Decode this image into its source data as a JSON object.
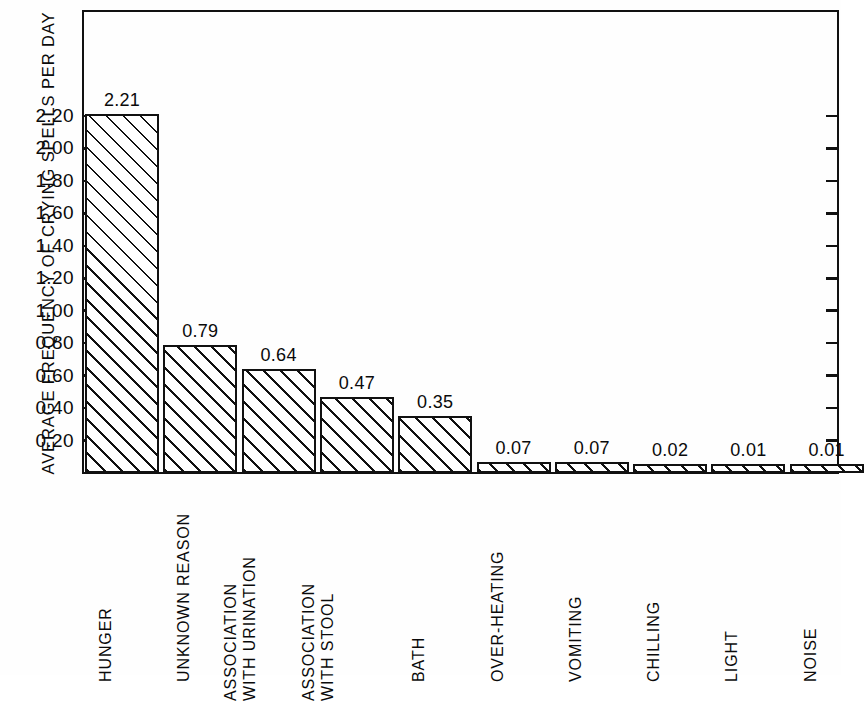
{
  "chart_data": {
    "type": "bar",
    "title": "",
    "xlabel": "",
    "ylabel": "AVERAGE FREQUENCY OF CRYING SPELLS PER DAY",
    "ylim": [
      0,
      2.32
    ],
    "grid": false,
    "legend": null,
    "categories": [
      "HUNGER",
      "UNKNOWN REASON",
      "ASSOCIATION WITH URINATION",
      "ASSOCIATION WITH STOOL",
      "BATH",
      "OVER-HEATING",
      "VOMITING",
      "CHILLING",
      "LIGHT",
      "NOISE"
    ],
    "values": [
      2.21,
      0.79,
      0.64,
      0.47,
      0.35,
      0.07,
      0.07,
      0.02,
      0.01,
      0.01
    ],
    "value_labels": [
      "2.21",
      "0.79",
      "0.64",
      "0.47",
      "0.35",
      "0.07",
      "0.07",
      "0.02",
      "0.01",
      "0.01"
    ],
    "ytick_values": [
      2.2,
      2.0,
      1.8,
      1.6,
      1.4,
      1.2,
      1.0,
      0.8,
      0.6,
      0.4,
      0.2
    ],
    "ytick_labels": [
      "2.20",
      "2.00",
      "1.80",
      "1.60",
      "1.40",
      "1.20",
      "1.00",
      "0.80",
      "0.60",
      "0.40",
      "0.20"
    ],
    "category_label_lines": [
      [
        "HUNGER"
      ],
      [
        "UNKNOWN REASON"
      ],
      [
        "ASSOCIATION",
        "WITH URINATION"
      ],
      [
        "ASSOCIATION",
        "WITH STOOL"
      ],
      [
        "BATH"
      ],
      [
        "OVER-HEATING"
      ],
      [
        "VOMITING"
      ],
      [
        "CHILLING"
      ],
      [
        "LIGHT"
      ],
      [
        "NOISE"
      ]
    ],
    "colors": {
      "background": "#fefefe",
      "axis": "#111111",
      "bar_edge": "#111111",
      "bar_fill": "#ffffff",
      "hatch": "#111111",
      "text": "#0a0a0a"
    }
  }
}
